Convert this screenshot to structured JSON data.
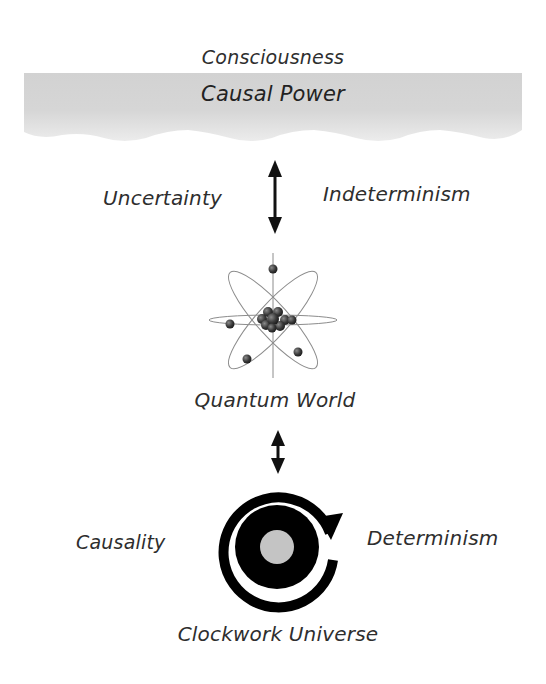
{
  "diagram": {
    "top": {
      "title": "Consciousness",
      "band_label": "Causal Power",
      "band_color": "#d9d9d9"
    },
    "upper_link": {
      "left_label": "Uncertainty",
      "right_label": "Indeterminism",
      "arrow": "double-headed-vertical"
    },
    "middle": {
      "icon": "atom-icon",
      "label": "Quantum World"
    },
    "lower_link": {
      "arrow": "double-headed-vertical-short"
    },
    "bottom": {
      "icon": "clockwork-cycle-icon",
      "left_label": "Causality",
      "right_label": "Determinism",
      "label": "Clockwork Universe",
      "center_color": "#c4c4c4"
    }
  }
}
